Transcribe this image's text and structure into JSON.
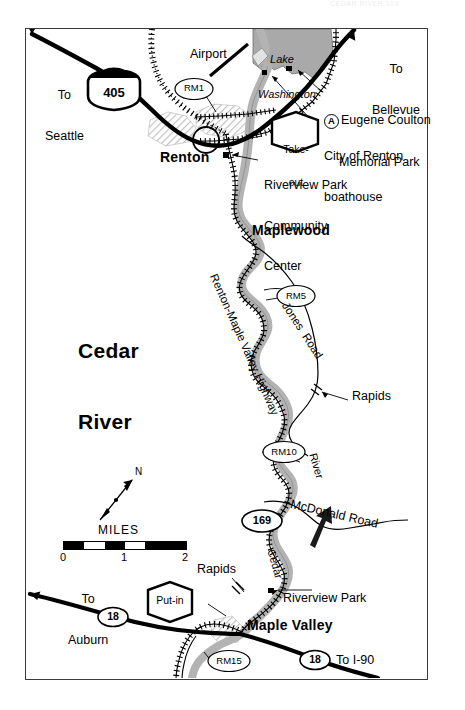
{
  "page": {
    "header_faint": "CEDAR RIVER   103",
    "width": 465,
    "height": 710
  },
  "map": {
    "title": "Cedar\nRiver",
    "title_line1": "Cedar",
    "title_line2": "River",
    "frame": {
      "x": 25,
      "y": 28,
      "w": 403,
      "h": 652
    }
  },
  "colors": {
    "river_fill": "#b3b3b3",
    "lake_fill": "#a9a9a9",
    "urban_hatch": "#cfcfcf",
    "road_black": "#000000",
    "frame_border": "#3a3a3a",
    "paper": "#ffffff"
  },
  "labels": {
    "to_seattle": "To\nSeattle",
    "to_seattle_l1": "To",
    "to_seattle_l2": "Seattle",
    "to_bellevue": "To\nBellevue",
    "to_bellevue_l1": "To",
    "to_bellevue_l2": "Bellevue",
    "to_auburn_l1": "To",
    "to_auburn_l2": "Auburn",
    "to_i90": "To I-90",
    "airport": "Airport",
    "lake_washington_l1": "Lake",
    "lake_washington_l2": "Washington",
    "renton": "Renton",
    "maplewood": "Maplewood",
    "maple_valley": "Maple Valley",
    "eugene_coulton_l1": "Eugene Coulton",
    "eugene_coulton_l2": "Memorial Park",
    "eugene_marker": "A",
    "boathouse_l1": "City of Renton",
    "boathouse_l2": "boathouse",
    "riverview_community_l1": "Riverview Park",
    "riverview_community_l2": "Community",
    "riverview_community_l3": "Center",
    "riverview_park": "Riverview Park",
    "rapids_upper": "Rapids",
    "rapids_lower": "Rapids",
    "renton_maple_valley_highway": "Renton-Maple Valley Highway",
    "jones_road": "Jones  Road",
    "mcdonald_road": "McDonald Road",
    "cedar_river_course_l1": "Cedar",
    "cedar_river_course_l2": "River",
    "miles": "MILES",
    "north": "N"
  },
  "access_points": [
    {
      "name": "take-out",
      "label_l1": "Take-",
      "label_l2": "out",
      "shape": "hexagon"
    },
    {
      "name": "put-in",
      "label_l1": "Put-in",
      "label_l2": "",
      "shape": "hexagon"
    }
  ],
  "river_mile_markers": [
    {
      "id": "RM1",
      "label": "RM1"
    },
    {
      "id": "RM5",
      "label": "RM5"
    },
    {
      "id": "RM10",
      "label": "RM10"
    },
    {
      "id": "RM15",
      "label": "RM15"
    }
  ],
  "route_shields": [
    {
      "id": "i405",
      "label": "405",
      "type": "interstate"
    },
    {
      "id": "sr169",
      "label": "169",
      "type": "state"
    },
    {
      "id": "sr18a",
      "label": "18",
      "type": "state"
    },
    {
      "id": "sr18b",
      "label": "18",
      "type": "state"
    }
  ],
  "scale": {
    "unit": "MILES",
    "ticks": [
      "0",
      "1",
      "2"
    ],
    "min": 0,
    "max": 2
  },
  "icons": {
    "north_arrow": "north-arrow-icon",
    "flow_arrow": "flow-direction-arrow-icon",
    "scale_bar": "scale-bar-icon"
  }
}
